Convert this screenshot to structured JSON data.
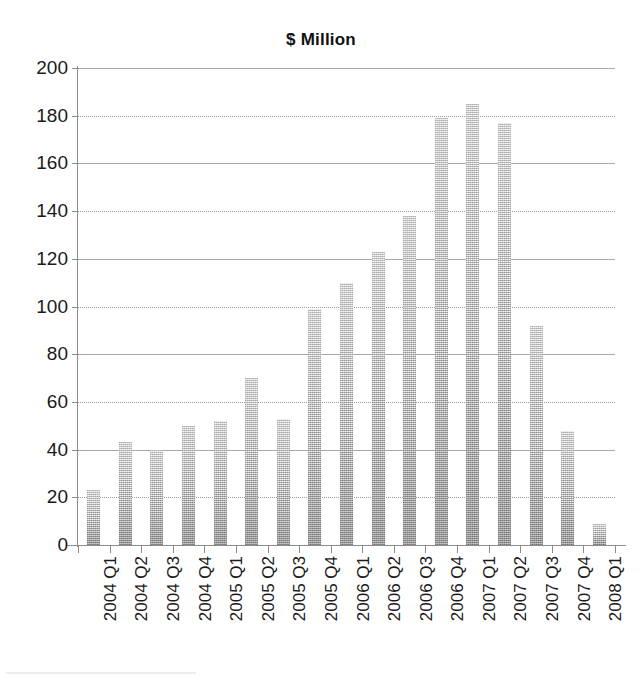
{
  "chart_data": {
    "type": "bar",
    "title": "$ Million",
    "xlabel": "",
    "ylabel": "",
    "ylim": [
      0,
      200
    ],
    "ytick_step": 20,
    "yticks": [
      0,
      20,
      40,
      60,
      80,
      100,
      120,
      140,
      160,
      180,
      200
    ],
    "ytick_labels": [
      "0",
      "20",
      "40",
      "60",
      "80",
      "100",
      "120",
      "140",
      "160",
      "180",
      "200"
    ],
    "grid": true,
    "legend": "none",
    "categories": [
      "2004 Q1",
      "2004 Q2",
      "2004 Q3",
      "2004 Q4",
      "2005 Q1",
      "2005 Q2",
      "2005 Q3",
      "2005 Q4",
      "2006 Q1",
      "2006 Q2",
      "2006 Q3",
      "2006 Q4",
      "2007 Q1",
      "2007 Q2",
      "2007 Q3",
      "2007 Q4",
      "2008 Q1"
    ],
    "values": [
      23,
      43,
      40,
      50,
      52,
      70,
      53,
      99,
      110,
      123,
      138,
      179,
      185,
      177,
      92,
      48,
      9
    ],
    "bar_color": "#c2c2c2",
    "axis_color": "#8c8c8c",
    "grid_color": "#a8a8a8",
    "text_color": "#1a1a1a"
  }
}
